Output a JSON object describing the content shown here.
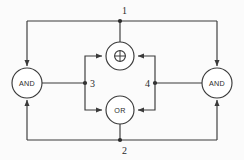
{
  "diagram": {
    "canvas": {
      "width": 244,
      "height": 160,
      "background": "#fbfbfb"
    },
    "stroke_color": "#3a3a3a",
    "text_color": "#2b2b2b",
    "gates": [
      {
        "id": "and-left",
        "label": "AND",
        "shape": "circle",
        "cx": 27,
        "cy": 83,
        "r": 15
      },
      {
        "id": "xor-top",
        "label": "⊕",
        "shape": "circle",
        "cx": 120,
        "cy": 56,
        "r": 14
      },
      {
        "id": "or-bottom",
        "label": "OR",
        "shape": "circle",
        "cx": 120,
        "cy": 110,
        "r": 14
      },
      {
        "id": "and-right",
        "label": "AND",
        "shape": "circle",
        "cx": 217,
        "cy": 83,
        "r": 15
      }
    ],
    "nodes": [
      {
        "id": "node-1",
        "label": "1",
        "x": 120,
        "y": 21,
        "label_x": 122,
        "label_y": 10
      },
      {
        "id": "node-2",
        "label": "2",
        "x": 120,
        "y": 140,
        "label_x": 122,
        "label_y": 150
      },
      {
        "id": "node-3",
        "label": "3",
        "x": 85,
        "y": 83,
        "label_x": 90,
        "label_y": 83
      },
      {
        "id": "node-4",
        "label": "4",
        "x": 155,
        "y": 83,
        "label_x": 144,
        "label_y": 83
      }
    ],
    "edges": [
      {
        "id": "edge-node1-to-and-left",
        "from": "node-1",
        "to": "and-left",
        "arrow": true
      },
      {
        "id": "edge-node1-to-and-right",
        "from": "node-1",
        "to": "and-right",
        "arrow": true
      },
      {
        "id": "edge-node2-to-and-left",
        "from": "node-2",
        "to": "and-left",
        "arrow": true
      },
      {
        "id": "edge-node2-to-and-right",
        "from": "node-2",
        "to": "and-right",
        "arrow": true
      },
      {
        "id": "edge-and-left-to-node3",
        "from": "and-left",
        "to": "node-3",
        "arrow": false
      },
      {
        "id": "edge-and-right-to-node4",
        "from": "and-right",
        "to": "node-4",
        "arrow": false
      },
      {
        "id": "edge-node3-to-xor",
        "from": "node-3",
        "to": "xor-top",
        "arrow": true
      },
      {
        "id": "edge-node3-to-or",
        "from": "node-3",
        "to": "or-bottom",
        "arrow": true
      },
      {
        "id": "edge-node4-to-xor",
        "from": "node-4",
        "to": "xor-top",
        "arrow": true
      },
      {
        "id": "edge-node4-to-or",
        "from": "node-4",
        "to": "or-bottom",
        "arrow": true
      },
      {
        "id": "edge-xor-to-node1",
        "from": "xor-top",
        "to": "node-1",
        "arrow": false
      },
      {
        "id": "edge-or-to-node2",
        "from": "or-bottom",
        "to": "node-2",
        "arrow": false
      }
    ]
  }
}
